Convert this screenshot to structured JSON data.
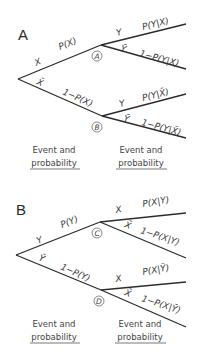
{
  "panels": [
    {
      "letter": "A",
      "root_branches": [
        {
          "event": "X",
          "prob": "P(X)"
        },
        {
          "event": "X̄",
          "prob": "1−P(X)"
        }
      ],
      "nodes": [
        {
          "label": "A",
          "branches": [
            {
              "event": "Y",
              "prob": "P(Y|X)"
            },
            {
              "event": "Ȳ",
              "prob": "1−P(Y|X)"
            }
          ]
        },
        {
          "label": "B",
          "branches": [
            {
              "event": "Y",
              "prob": "P(Y|X̄)"
            },
            {
              "event": "Ȳ",
              "prob": "1−P(Y|X̄)"
            }
          ]
        }
      ],
      "captions": [
        {
          "line1": "Event and",
          "line2": "probability"
        },
        {
          "line1": "Event and",
          "line2": "probability"
        }
      ]
    },
    {
      "letter": "B",
      "root_branches": [
        {
          "event": "Y",
          "prob": "P(Y)"
        },
        {
          "event": "Ȳ",
          "prob": "1−P(Y)"
        }
      ],
      "nodes": [
        {
          "label": "C",
          "branches": [
            {
              "event": "X",
              "prob": "P(X|Y)"
            },
            {
              "event": "X̄",
              "prob": "1−P(X|Y)"
            }
          ]
        },
        {
          "label": "D",
          "branches": [
            {
              "event": "X",
              "prob": "P(X|Ȳ)"
            },
            {
              "event": "X̄",
              "prob": "1−P(X|Ȳ)"
            }
          ]
        }
      ],
      "captions": [
        {
          "line1": "Event and",
          "line2": "probability"
        },
        {
          "line1": "Event and",
          "line2": "probability"
        }
      ]
    }
  ]
}
